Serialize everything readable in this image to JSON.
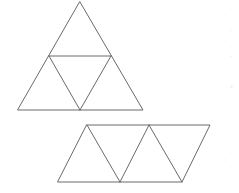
{
  "document": {
    "title": "Geometry figure: subdivided triangle and triangle strip",
    "background_color": "#ffffff",
    "stroke_color": "#6a6a6a",
    "stroke_width": 1,
    "width": 239,
    "height": 193
  },
  "figures": [
    {
      "id": "figure-top",
      "name": "subdivided-equilateral-triangle",
      "description": "Large triangle divided by a midline and an inverted inner triangle into four smaller triangles",
      "triangle_count": 4,
      "vertices": {
        "apex": [
          80,
          2
        ],
        "bottom_left": [
          18,
          110
        ],
        "bottom_right": [
          143,
          110
        ],
        "left_midpoint": [
          49,
          56
        ],
        "right_midpoint": [
          111,
          56
        ]
      },
      "outline_path": "M 80 2 L 143 110 L 18 110 Z",
      "interior_paths": [
        "M 49 56 L 111 56",
        "M 49 56 L 80 110",
        "M 111 56 L 80 110"
      ]
    },
    {
      "id": "figure-bottom",
      "name": "triangle-strip-parallelogram",
      "description": "Parallelogram strip subdivided into four alternating triangles",
      "triangle_count": 4,
      "vertices": {
        "top_left": [
          87,
          125
        ],
        "top_mid": [
          149,
          125
        ],
        "top_right": [
          210,
          125
        ],
        "bottom_left": [
          58,
          182
        ],
        "bottom_mid": [
          120,
          182
        ],
        "bottom_right": [
          182,
          182
        ]
      },
      "outline_path": "M 87 125 L 210 125 L 182 182 L 58 182 Z",
      "interior_paths": [
        "M 87 125 L 120 182",
        "M 120 182 L 149 125",
        "M 149 125 L 182 182"
      ]
    }
  ],
  "margin_noise": {
    "visible": true,
    "marks": [
      {
        "top": 6,
        "text": "·"
      },
      {
        "top": 18,
        "text": "·"
      },
      {
        "top": 27,
        "text": ":"
      },
      {
        "top": 36,
        "text": "·"
      },
      {
        "top": 45,
        "text": "·"
      },
      {
        "top": 54,
        "text": "="
      },
      {
        "top": 63,
        "text": "·"
      },
      {
        "top": 72,
        "text": "·"
      },
      {
        "top": 84,
        "text": "≡"
      },
      {
        "top": 96,
        "text": "·"
      },
      {
        "top": 108,
        "text": "·"
      },
      {
        "top": 120,
        "text": "·"
      },
      {
        "top": 150,
        "text": "·"
      },
      {
        "top": 165,
        "text": "·"
      },
      {
        "top": 177,
        "text": "·"
      }
    ]
  }
}
